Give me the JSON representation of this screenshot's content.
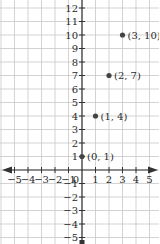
{
  "chart_data": {
    "type": "scatter",
    "title": "",
    "xlabel": "x",
    "ylabel": "y",
    "xlim": [
      -5,
      5
    ],
    "ylim": [
      -5,
      12
    ],
    "grid": true,
    "x_ticks": [
      -5,
      -4,
      -3,
      -2,
      -1,
      1,
      2,
      3,
      4,
      5
    ],
    "y_ticks": [
      -5,
      -4,
      -3,
      -2,
      -1,
      1,
      2,
      3,
      4,
      5,
      6,
      7,
      8,
      9,
      10,
      11,
      12
    ],
    "origin_label": "0",
    "points": [
      {
        "x": 0,
        "y": 1,
        "label": "(0, 1)"
      },
      {
        "x": 1,
        "y": 4,
        "label": "(1, 4)"
      },
      {
        "x": 2,
        "y": 7,
        "label": "(2, 7)"
      },
      {
        "x": 3,
        "y": 10,
        "label": "(3, 10)"
      }
    ]
  },
  "colors": {
    "grid": "#c8c8c8",
    "axis": "#333333",
    "point": "#444444",
    "text": "#2a2a2a"
  },
  "layout": {
    "origin_px": [
      82,
      170
    ],
    "unit_px": 13.5
  }
}
